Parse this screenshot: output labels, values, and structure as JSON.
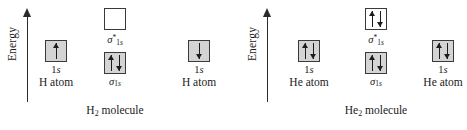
{
  "figure": {
    "type": "molecular-orbital-energy-diagram",
    "title": "",
    "background_color": "#ffffff",
    "box_border_color": "#3a3a3a",
    "box_fill_occupied": "#d4d4d4",
    "box_fill_empty": "#ffffff",
    "arrow_color": "#1c1c1c"
  },
  "diagrams": [
    {
      "id": "h2",
      "axis": {
        "label": "Energy",
        "direction": "up",
        "icon": "up-arrow-icon"
      },
      "left_atom": {
        "orbital_label": "1s",
        "species_label": "H atom",
        "electrons": [
          "up"
        ],
        "box_fill": "shaded"
      },
      "molecular_orbitals": {
        "antibonding": {
          "label_sigma": "σ",
          "label_sub": "1s",
          "label_sup": "*",
          "label_full": "σ*1s",
          "electrons": [],
          "box_fill": "empty"
        },
        "bonding": {
          "label_sigma": "σ",
          "label_sub": "1s",
          "label_sup": "",
          "label_full": "σ1s",
          "electrons": [
            "up",
            "down"
          ],
          "box_fill": "shaded"
        },
        "species_label_pre": "H",
        "species_label_sub": "2",
        "species_label_post": " molecule"
      },
      "right_atom": {
        "orbital_label": "1s",
        "species_label": "H atom",
        "electrons": [
          "down"
        ],
        "box_fill": "shaded"
      }
    },
    {
      "id": "he2",
      "axis": {
        "label": "Energy",
        "direction": "up",
        "icon": "up-arrow-icon"
      },
      "left_atom": {
        "orbital_label": "1s",
        "species_label": "He atom",
        "electrons": [
          "up",
          "down"
        ],
        "box_fill": "shaded"
      },
      "molecular_orbitals": {
        "antibonding": {
          "label_sigma": "σ",
          "label_sub": "1s",
          "label_sup": "*",
          "label_full": "σ*1s",
          "electrons": [
            "up",
            "down"
          ],
          "box_fill": "empty"
        },
        "bonding": {
          "label_sigma": "σ",
          "label_sub": "1s",
          "label_sup": "",
          "label_full": "σ1s",
          "electrons": [
            "up",
            "down"
          ],
          "box_fill": "shaded"
        },
        "species_label_pre": "He",
        "species_label_sub": "2",
        "species_label_post": " molecule"
      },
      "right_atom": {
        "orbital_label": "1s",
        "species_label": "He atom",
        "electrons": [
          "up",
          "down"
        ],
        "box_fill": "shaded"
      }
    }
  ]
}
